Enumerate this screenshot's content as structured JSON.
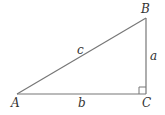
{
  "diagram": {
    "type": "right-triangle",
    "vertices": {
      "A": {
        "label": "A",
        "x": 17,
        "y": 94
      },
      "B": {
        "label": "B",
        "x": 146,
        "y": 18
      },
      "C": {
        "label": "C",
        "x": 146,
        "y": 94
      }
    },
    "sides": {
      "a": {
        "label": "a",
        "between": [
          "B",
          "C"
        ]
      },
      "b": {
        "label": "b",
        "between": [
          "A",
          "C"
        ]
      },
      "c": {
        "label": "c",
        "between": [
          "A",
          "B"
        ]
      }
    },
    "right_angle_at": "C",
    "colors": {
      "stroke": "#777777",
      "text": "#333333",
      "background": "#ffffff"
    }
  }
}
